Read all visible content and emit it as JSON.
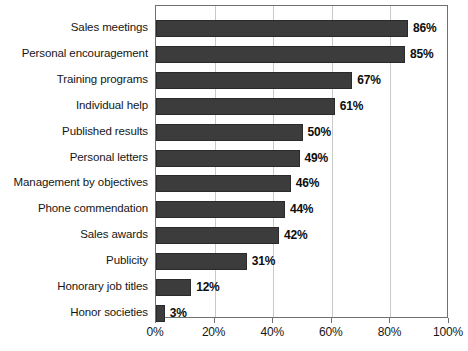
{
  "chart_data": {
    "type": "bar",
    "orientation": "horizontal",
    "title": "",
    "subtitle": "",
    "xlabel": "",
    "ylabel": "",
    "xlim": [
      0,
      100
    ],
    "grid": true,
    "legend": false,
    "legend_position": "none",
    "bar_color": "#3c3c3c",
    "axis_color": "#6f6f6f",
    "gridline_color": "#c9c9c9",
    "background": "#ffffff",
    "value_suffix": "%",
    "categories": [
      "Sales meetings",
      "Personal encouragement",
      "Training programs",
      "Individual help",
      "Published results",
      "Personal letters",
      "Management by objectives",
      "Phone commendation",
      "Sales awards",
      "Publicity",
      "Honorary job titles",
      "Honor societies"
    ],
    "values": [
      86,
      85,
      67,
      61,
      50,
      49,
      46,
      44,
      42,
      31,
      12,
      3
    ],
    "data_labels": [
      "86%",
      "85%",
      "67%",
      "61%",
      "50%",
      "49%",
      "46%",
      "44%",
      "42%",
      "31%",
      "12%",
      "3%"
    ],
    "xticks": [
      0,
      20,
      40,
      60,
      80,
      100
    ],
    "xtick_labels": [
      "0%",
      "20%",
      "40%",
      "60%",
      "80%",
      "100%"
    ]
  }
}
